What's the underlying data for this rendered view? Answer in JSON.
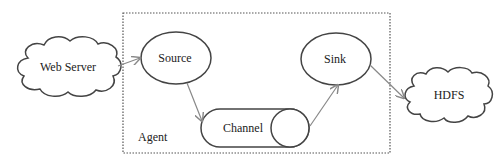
{
  "diagram": {
    "type": "flume-architecture",
    "nodes": {
      "web_server": {
        "label": "Web Server",
        "shape": "cloud"
      },
      "source": {
        "label": "Source",
        "shape": "ellipse"
      },
      "channel": {
        "label": "Channel",
        "shape": "cylinder"
      },
      "sink": {
        "label": "Sink",
        "shape": "ellipse"
      },
      "hdfs": {
        "label": "HDFS",
        "shape": "cloud"
      }
    },
    "container": {
      "label": "Agent",
      "style": "dotted"
    },
    "edges": [
      {
        "from": "web_server",
        "to": "source"
      },
      {
        "from": "source",
        "to": "channel"
      },
      {
        "from": "channel",
        "to": "sink"
      },
      {
        "from": "sink",
        "to": "hdfs"
      }
    ],
    "colors": {
      "stroke": "#444444",
      "arrow": "#888888",
      "border": "#555555"
    }
  }
}
